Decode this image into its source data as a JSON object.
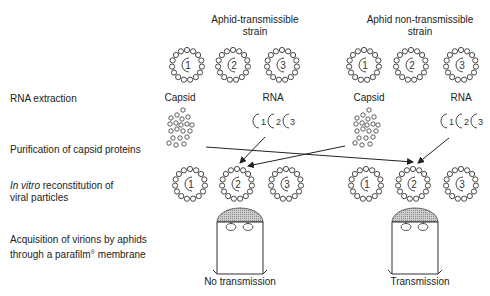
{
  "headers": {
    "left": {
      "line1": "Aphid-transmissible",
      "line2": "strain"
    },
    "right": {
      "line1": "Aphid non-transmissible",
      "line2": "strain"
    }
  },
  "steps": [
    {
      "label": "RNA extraction"
    },
    {
      "label": "Purification of capsid proteins"
    },
    {
      "label_italic": "In vitro",
      "label_rest": " reconstitution of",
      "label_line2": "viral particles"
    },
    {
      "label_line1": "Acquisition of virions by aphids",
      "label_line2_pre": "through a parafilm",
      "label_sup": "®",
      "label_line2_post": " membrane"
    }
  ],
  "components": {
    "left_capsid": "Capsid",
    "left_rna": "RNA",
    "right_capsid": "Capsid",
    "right_rna": "RNA"
  },
  "particle_numbers": [
    "1",
    "2",
    "3"
  ],
  "results": {
    "left": "No transmission",
    "right": "Transmission"
  },
  "colors": {
    "line": "#222222",
    "bead": "#333333",
    "hatch": "#bbbbbb"
  }
}
